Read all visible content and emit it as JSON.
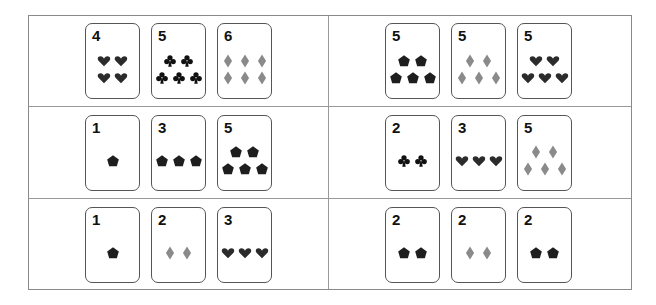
{
  "colors": {
    "heart": "#2b2b2b",
    "club": "#111111",
    "diamond": "#8a8a8a",
    "pentagon": "#1e1e1e"
  },
  "grid": {
    "rows": 3,
    "cols": 2,
    "cells": [
      {
        "row": 0,
        "col": 0,
        "cards": [
          {
            "rank": "4",
            "suit": "heart",
            "count": 4,
            "layout": [
              2,
              2
            ]
          },
          {
            "rank": "5",
            "suit": "club",
            "count": 5,
            "layout": [
              2,
              3
            ]
          },
          {
            "rank": "6",
            "suit": "diamond",
            "count": 6,
            "layout": [
              3,
              3
            ]
          }
        ]
      },
      {
        "row": 0,
        "col": 1,
        "cards": [
          {
            "rank": "5",
            "suit": "pentagon",
            "count": 5,
            "layout": [
              2,
              3
            ]
          },
          {
            "rank": "5",
            "suit": "diamond",
            "count": 5,
            "layout": [
              2,
              3
            ]
          },
          {
            "rank": "5",
            "suit": "heart",
            "count": 5,
            "layout": [
              2,
              3
            ]
          }
        ]
      },
      {
        "row": 1,
        "col": 0,
        "cards": [
          {
            "rank": "1",
            "suit": "pentagon",
            "count": 1,
            "layout": [
              1
            ]
          },
          {
            "rank": "3",
            "suit": "pentagon",
            "count": 3,
            "layout": [
              3
            ]
          },
          {
            "rank": "5",
            "suit": "pentagon",
            "count": 5,
            "layout": [
              2,
              3
            ]
          }
        ]
      },
      {
        "row": 1,
        "col": 1,
        "cards": [
          {
            "rank": "2",
            "suit": "club",
            "count": 2,
            "layout": [
              2
            ]
          },
          {
            "rank": "3",
            "suit": "heart",
            "count": 3,
            "layout": [
              3
            ]
          },
          {
            "rank": "5",
            "suit": "diamond",
            "count": 5,
            "layout": [
              2,
              3
            ]
          }
        ]
      },
      {
        "row": 2,
        "col": 0,
        "cards": [
          {
            "rank": "1",
            "suit": "pentagon",
            "count": 1,
            "layout": [
              1
            ]
          },
          {
            "rank": "2",
            "suit": "diamond",
            "count": 2,
            "layout": [
              2
            ]
          },
          {
            "rank": "3",
            "suit": "heart",
            "count": 3,
            "layout": [
              3
            ]
          }
        ]
      },
      {
        "row": 2,
        "col": 1,
        "cards": [
          {
            "rank": "2",
            "suit": "pentagon",
            "count": 2,
            "layout": [
              2
            ]
          },
          {
            "rank": "2",
            "suit": "diamond",
            "count": 2,
            "layout": [
              2
            ]
          },
          {
            "rank": "2",
            "suit": "pentagon",
            "count": 2,
            "layout": [
              2
            ]
          }
        ]
      }
    ]
  }
}
